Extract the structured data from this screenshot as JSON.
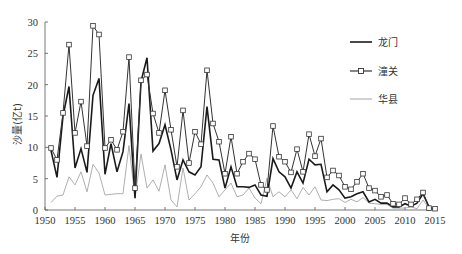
{
  "chart_data": {
    "type": "line",
    "title": "",
    "xlabel": "年份",
    "ylabel": "沙量(亿t)",
    "xlim": [
      1950,
      2015
    ],
    "ylim": [
      0,
      30
    ],
    "x_ticks": [
      "1950",
      "1955",
      "1960",
      "1965",
      "1970",
      "1975",
      "1980",
      "1985",
      "1990",
      "1995",
      "2000",
      "2005",
      "2010",
      "2015"
    ],
    "y_ticks": [
      "0",
      "5",
      "10",
      "15",
      "20",
      "25",
      "30"
    ],
    "grid": false,
    "legend_position": "upper right",
    "x": [
      1951,
      1952,
      1953,
      1954,
      1955,
      1956,
      1957,
      1958,
      1959,
      1960,
      1961,
      1962,
      1963,
      1964,
      1965,
      1966,
      1967,
      1968,
      1969,
      1970,
      1971,
      1972,
      1973,
      1974,
      1975,
      1976,
      1977,
      1978,
      1979,
      1980,
      1981,
      1982,
      1983,
      1984,
      1985,
      1986,
      1987,
      1988,
      1989,
      1990,
      1991,
      1992,
      1993,
      1994,
      1995,
      1996,
      1997,
      1998,
      1999,
      2000,
      2001,
      2002,
      2003,
      2004,
      2005,
      2006,
      2007,
      2008,
      2009,
      2010,
      2011,
      2012,
      2013,
      2014,
      2015
    ],
    "series": [
      {
        "name": "龙门",
        "style": "thick-black",
        "values": [
          9.5,
          5.2,
          15.0,
          19.7,
          6.7,
          9.8,
          6.0,
          18.3,
          21.0,
          5.7,
          10.6,
          6.1,
          9.3,
          17.0,
          1.9,
          20.5,
          24.3,
          9.4,
          10.6,
          13.6,
          9.6,
          4.8,
          8.0,
          6.1,
          5.6,
          6.9,
          16.5,
          8.1,
          8.0,
          3.5,
          6.9,
          3.7,
          3.7,
          3.6,
          4.0,
          2.4,
          2.2,
          8.2,
          6.1,
          5.3,
          3.5,
          6.1,
          4.3,
          8.1,
          7.2,
          7.3,
          2.9,
          4.0,
          3.2,
          1.9,
          2.1,
          2.6,
          2.9,
          1.3,
          1.7,
          1.1,
          1.1,
          0.5,
          0.5,
          1.0,
          0.6,
          1.1,
          2.6,
          0.5,
          0.1
        ]
      },
      {
        "name": "潼关",
        "style": "black-square-markers",
        "values": [
          9.9,
          8.0,
          15.5,
          26.4,
          12.3,
          17.3,
          10.2,
          29.4,
          28.0,
          9.9,
          11.2,
          9.6,
          12.5,
          24.4,
          3.5,
          20.7,
          21.6,
          15.4,
          12.3,
          19.1,
          12.8,
          6.9,
          15.9,
          7.5,
          12.5,
          10.5,
          22.3,
          13.8,
          10.9,
          5.8,
          11.7,
          5.8,
          7.7,
          9.0,
          8.1,
          4.0,
          3.2,
          13.4,
          8.5,
          7.7,
          6.0,
          9.7,
          6.1,
          12.1,
          8.6,
          11.4,
          5.2,
          6.3,
          5.5,
          3.7,
          3.3,
          4.5,
          5.8,
          3.5,
          3.1,
          2.1,
          2.4,
          1.0,
          0.9,
          1.9,
          0.9,
          1.7,
          2.8,
          0.3,
          0.2
        ]
      },
      {
        "name": "华县",
        "style": "thin-gray",
        "values": [
          1.2,
          2.2,
          2.4,
          5.3,
          4.0,
          6.1,
          2.9,
          7.3,
          5.9,
          2.4,
          2.5,
          2.6,
          2.6,
          10.3,
          1.9,
          8.9,
          3.5,
          4.8,
          3.0,
          7.2,
          1.6,
          0.5,
          6.7,
          1.6,
          2.6,
          3.7,
          5.6,
          4.3,
          2.1,
          3.2,
          4.3,
          2.1,
          2.4,
          3.5,
          1.9,
          1.0,
          5.1,
          2.1,
          2.9,
          2.1,
          3.2,
          1.8,
          3.6,
          2.4,
          3.7,
          1.6,
          1.5,
          1.7,
          1.8,
          1.2,
          1.7,
          1.3,
          2.0,
          1.1,
          1.0,
          0.9,
          0.9,
          0.3,
          0.3,
          0.3,
          0.5,
          0.2,
          1.6,
          0.3,
          0.1
        ]
      }
    ]
  },
  "legend": {
    "items": [
      {
        "label": "龙门"
      },
      {
        "label": "潼关"
      },
      {
        "label": "华县"
      }
    ]
  },
  "colors": {
    "longmen": "#1a1a1a",
    "tongguan": "#333333",
    "huaxian": "#9a9a9a",
    "axis": "#555555"
  }
}
